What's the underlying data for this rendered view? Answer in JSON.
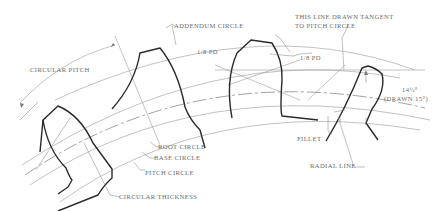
{
  "labels": {
    "addendum_circle": "ADDENDUM CIRCLE",
    "tangent_line_1": "THIS LINE DRAWN TANGENT",
    "tangent_line_2": "TO PITCH CIRCLE",
    "circular_pitch": "CIRCULAR PITCH",
    "one_eighth_pd_left": "1/8 PD",
    "one_eighth_pd_right": "1/8 PD",
    "pressure_angle": "14½°",
    "drawn_angle": "(DRAWN 15°)",
    "root_circle": "ROOT CIRCLE",
    "base_circle": "BASE CIRCLE",
    "pitch_circle": "PITCH CIRCLE",
    "circular_thickness": "CIRCULAR THICKNESS",
    "fillet": "FILLET",
    "radial_line": "RADIAL LINE"
  }
}
